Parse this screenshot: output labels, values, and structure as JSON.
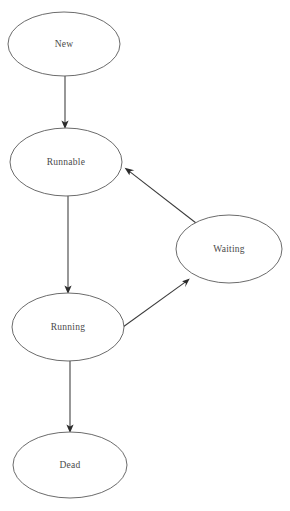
{
  "diagram": {
    "kind": "state-transition-diagram",
    "background_color": "#ffffff",
    "node_stroke_color": "#5a5a5a",
    "edge_color": "#3a3a3a",
    "label_color": "#4a4a4a",
    "nodes": [
      {
        "id": "new",
        "label": "New",
        "shape": "ellipse",
        "cx": 64,
        "cy": 44,
        "rx": 56,
        "ry": 32
      },
      {
        "id": "runnable",
        "label": "Runnable",
        "shape": "ellipse",
        "cx": 66,
        "cy": 162,
        "rx": 56,
        "ry": 34
      },
      {
        "id": "waiting",
        "label": "Waiting",
        "shape": "ellipse",
        "cx": 229,
        "cy": 249,
        "rx": 53,
        "ry": 34
      },
      {
        "id": "running",
        "label": "Running",
        "shape": "ellipse",
        "cx": 68,
        "cy": 327,
        "rx": 56,
        "ry": 34
      },
      {
        "id": "dead",
        "label": "Dead",
        "shape": "ellipse",
        "cx": 70,
        "cy": 465,
        "rx": 57,
        "ry": 33
      }
    ],
    "edges": [
      {
        "id": "new-to-runnable",
        "from": "new",
        "to": "runnable",
        "label": "",
        "x1": 65,
        "y1": 76,
        "x2": 65,
        "y2": 128
      },
      {
        "id": "runnable-to-running",
        "from": "runnable",
        "to": "running",
        "label": "",
        "x1": 68,
        "y1": 196,
        "x2": 68,
        "y2": 293
      },
      {
        "id": "running-to-waiting",
        "from": "running",
        "to": "waiting",
        "label": "",
        "x1": 123,
        "y1": 327,
        "x2": 189,
        "y2": 279
      },
      {
        "id": "waiting-to-runnable",
        "from": "waiting",
        "to": "runnable",
        "label": "",
        "x1": 196,
        "y1": 223,
        "x2": 125,
        "y2": 168
      },
      {
        "id": "running-to-dead",
        "from": "running",
        "to": "dead",
        "label": "",
        "x1": 70,
        "y1": 361,
        "x2": 70,
        "y2": 432
      }
    ]
  }
}
